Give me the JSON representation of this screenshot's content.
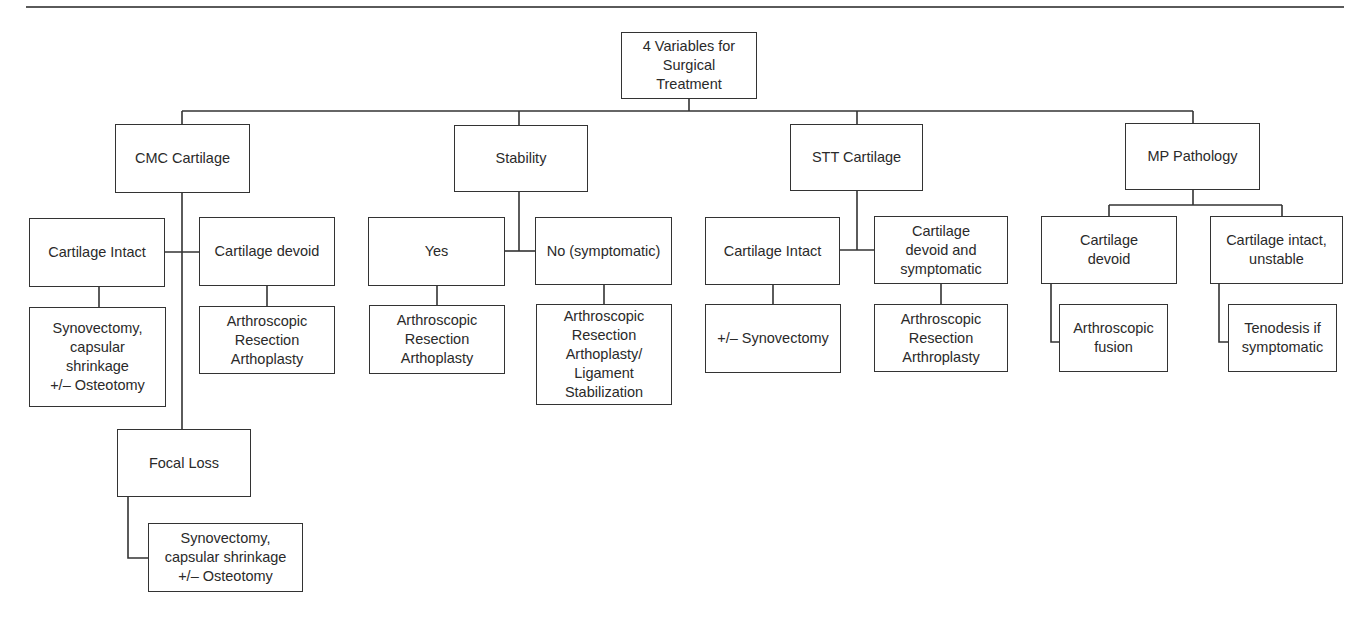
{
  "root": {
    "label": "4 Variables for\nSurgical\nTreatment"
  },
  "variables": [
    {
      "label": "CMC Cartilage",
      "branches": [
        {
          "label": "Cartilage Intact",
          "treatment": "Synovectomy,\ncapsular\nshrinkage\n+/– Osteotomy"
        },
        {
          "label": "Cartilage devoid",
          "treatment": "Arthroscopic\nResection\nArthoplasty"
        },
        {
          "label": "Focal Loss",
          "treatment": "Synovectomy,\ncapsular shrinkage\n+/– Osteotomy"
        }
      ]
    },
    {
      "label": "Stability",
      "branches": [
        {
          "label": "Yes",
          "treatment": "Arthroscopic\nResection\nArthoplasty"
        },
        {
          "label": "No (symptomatic)",
          "treatment": "Arthroscopic\nResection\nArthoplasty/\nLigament\nStabilization"
        }
      ]
    },
    {
      "label": "STT Cartilage",
      "branches": [
        {
          "label": "Cartilage Intact",
          "treatment": "+/– Synovectomy"
        },
        {
          "label": "Cartilage\ndevoid and\nsymptomatic",
          "treatment": "Arthroscopic\nResection\nArthroplasty"
        }
      ]
    },
    {
      "label": "MP Pathology",
      "branches": [
        {
          "label": "Cartilage\ndevoid",
          "treatment": "Arthroscopic\nfusion"
        },
        {
          "label": "Cartilage intact,\nunstable",
          "treatment": "Tenodesis if\nsymptomatic"
        }
      ]
    }
  ]
}
